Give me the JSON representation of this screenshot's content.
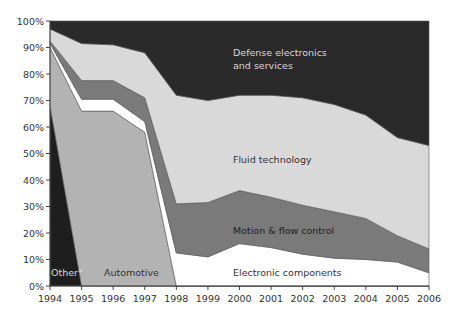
{
  "chart_data": {
    "type": "area",
    "stacked": true,
    "normalized": true,
    "title": "",
    "xlabel": "",
    "ylabel": "",
    "x": [
      1994,
      1995,
      1996,
      1997,
      1998,
      1999,
      2000,
      2001,
      2002,
      2003,
      2004,
      2005,
      2006
    ],
    "ylim": [
      0,
      100
    ],
    "y_ticks": [
      "0%",
      "10%",
      "20%",
      "30%",
      "40%",
      "50%",
      "60%",
      "70%",
      "80%",
      "90%",
      "100%"
    ],
    "x_ticks": [
      "1994",
      "1995",
      "1996",
      "1997",
      "1998",
      "1999",
      "2000",
      "2001",
      "2002",
      "2003",
      "2004",
      "2005",
      "2006"
    ],
    "grid": false,
    "legend": "inline labels",
    "series": [
      {
        "name": "Other*",
        "color": "#1e1e1e",
        "label_color": "#d8d8d8",
        "values": [
          68,
          0,
          0,
          0,
          0,
          0,
          0,
          0,
          0,
          0,
          0,
          0,
          0
        ]
      },
      {
        "name": "Automotive",
        "color": "#b3b3b3",
        "label_color": "#333333",
        "values": [
          22,
          66,
          66,
          58,
          0,
          0,
          0,
          0,
          0,
          0,
          0,
          0,
          0
        ]
      },
      {
        "name": "Electronic components",
        "color": "#ffffff",
        "label_color": "#333333",
        "values": [
          1.5,
          4.5,
          4.5,
          4,
          12.5,
          11,
          16,
          14.5,
          12,
          10.5,
          10,
          9,
          5
        ]
      },
      {
        "name": "Motion & flow control",
        "color": "#7a7a7a",
        "label_color": "#222222",
        "values": [
          1,
          7,
          7,
          9,
          18.5,
          20.5,
          20,
          19,
          18.5,
          17.5,
          15.5,
          10,
          9
        ]
      },
      {
        "name": "Fluid technology",
        "color": "#d9d9d9",
        "label_color": "#333333",
        "values": [
          4.5,
          14,
          13.5,
          17,
          41,
          38.5,
          36,
          38.5,
          40.5,
          40.5,
          39,
          37,
          39
        ]
      },
      {
        "name": "Defense electronics and services",
        "color": "#2a2a2a",
        "label_color": "#d8d8d8",
        "values": [
          3,
          8.5,
          9,
          12,
          28,
          30,
          28,
          28,
          29,
          31.5,
          35.5,
          44,
          47
        ]
      }
    ],
    "annotations": [
      {
        "text": "Defense electronics",
        "x": 233,
        "y": 56
      },
      {
        "text": "and services",
        "x": 233,
        "y": 69
      },
      {
        "text": "Fluid technology",
        "x": 233,
        "y": 163
      },
      {
        "text": "Motion & flow control",
        "x": 233,
        "y": 234
      },
      {
        "text": "Electronic components",
        "x": 233,
        "y": 276
      },
      {
        "text": "Automotive",
        "x": 104,
        "y": 276
      },
      {
        "text": "Other*",
        "x": 51,
        "y": 276
      }
    ]
  },
  "labels": {
    "defense_line1": "Defense electronics",
    "defense_line2": "and services",
    "fluid": "Fluid technology",
    "motion": "Motion & flow control",
    "electronic": "Electronic components",
    "automotive": "Automotive",
    "other": "Other*"
  }
}
